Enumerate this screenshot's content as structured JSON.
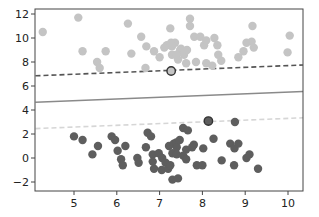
{
  "chart_data": {
    "type": "scatter",
    "title": "",
    "xlabel": "",
    "ylabel": "",
    "xlim": [
      4.1,
      10.35
    ],
    "ylim": [
      -2.5,
      12.5
    ],
    "grid": false,
    "legend": null,
    "x_ticks": [
      5,
      6,
      7,
      8,
      9,
      10
    ],
    "y_ticks": [
      -2,
      0,
      2,
      4,
      6,
      8,
      10,
      12
    ],
    "x_tick_labels": [
      "5",
      "6",
      "7",
      "8",
      "9",
      "10"
    ],
    "y_tick_labels": [
      "−2",
      "0",
      "2",
      "4",
      "6",
      "8",
      "10",
      "12"
    ],
    "colors": {
      "class_light": "#c4c4c4",
      "class_dark": "#5e5e5e",
      "margin_upper": "#555555",
      "decision_boundary": "#8a8a8a",
      "margin_lower": "#d6d6d6",
      "axis": "#444444",
      "support_vector_ring": "#333333"
    },
    "series": [
      {
        "name": "class_light",
        "points": [
          [
            4.27,
            10.5
          ],
          [
            5.1,
            11.7
          ],
          [
            5.2,
            8.9
          ],
          [
            5.74,
            8.9
          ],
          [
            6.26,
            11.2
          ],
          [
            6.34,
            8.7
          ],
          [
            5.54,
            8.0
          ],
          [
            5.6,
            7.5
          ],
          [
            6.57,
            10.1
          ],
          [
            6.69,
            9.3
          ],
          [
            6.87,
            8.9
          ],
          [
            7.0,
            8.4
          ],
          [
            6.67,
            7.5
          ],
          [
            7.27,
            9.6
          ],
          [
            7.17,
            9.4
          ],
          [
            7.36,
            9.6
          ],
          [
            7.5,
            9.1
          ],
          [
            7.29,
            8.6
          ],
          [
            7.48,
            9.0
          ],
          [
            7.57,
            8.6
          ],
          [
            7.64,
            9.0
          ],
          [
            7.43,
            8.2
          ],
          [
            7.62,
            7.9
          ],
          [
            7.81,
            10.1
          ],
          [
            7.71,
            11.0
          ],
          [
            7.71,
            11.6
          ],
          [
            7.95,
            10.1
          ],
          [
            8.04,
            9.4
          ],
          [
            8.09,
            9.8
          ],
          [
            8.28,
            10.0
          ],
          [
            8.35,
            9.4
          ],
          [
            8.37,
            8.6
          ],
          [
            7.85,
            8.0
          ],
          [
            8.09,
            7.9
          ],
          [
            8.23,
            7.7
          ],
          [
            8.44,
            8.1
          ],
          [
            8.84,
            8.4
          ],
          [
            8.96,
            8.9
          ],
          [
            9.03,
            9.6
          ],
          [
            9.15,
            9.7
          ],
          [
            9.17,
            11.0
          ],
          [
            9.2,
            9.2
          ],
          [
            10.04,
            10.2
          ],
          [
            9.99,
            8.8
          ],
          [
            7.25,
            10.8
          ],
          [
            7.29,
            9.3
          ],
          [
            7.11,
            9.2
          ],
          [
            7.39,
            8.6
          ]
        ]
      },
      {
        "name": "class_dark",
        "points": [
          [
            5.0,
            1.8
          ],
          [
            5.2,
            1.5
          ],
          [
            5.43,
            0.3
          ],
          [
            5.56,
            1.0
          ],
          [
            5.88,
            1.8
          ],
          [
            5.96,
            1.5
          ],
          [
            6.02,
            0.6
          ],
          [
            6.1,
            -0.1
          ],
          [
            6.14,
            -0.6
          ],
          [
            6.2,
            1.0
          ],
          [
            6.48,
            0.0
          ],
          [
            6.51,
            -0.4
          ],
          [
            6.72,
            2.1
          ],
          [
            6.8,
            1.8
          ],
          [
            6.68,
            0.9
          ],
          [
            6.84,
            0.3
          ],
          [
            6.87,
            -0.9
          ],
          [
            6.84,
            -0.3
          ],
          [
            6.98,
            0.4
          ],
          [
            7.05,
            -1.0
          ],
          [
            7.22,
            1.0
          ],
          [
            7.3,
            0.4
          ],
          [
            7.33,
            1.2
          ],
          [
            7.39,
            1.3
          ],
          [
            7.06,
            0.0
          ],
          [
            7.14,
            -0.4
          ],
          [
            7.2,
            -0.9
          ],
          [
            7.3,
            -1.8
          ],
          [
            7.43,
            -1.7
          ],
          [
            7.25,
            -0.6
          ],
          [
            7.4,
            0.9
          ],
          [
            7.55,
            2.5
          ],
          [
            7.62,
            0.7
          ],
          [
            7.4,
            0.3
          ],
          [
            7.55,
            0.2
          ],
          [
            7.62,
            -0.1
          ],
          [
            7.8,
            1.1
          ],
          [
            7.76,
            0.9
          ],
          [
            7.87,
            -0.6
          ],
          [
            8.0,
            -0.6
          ],
          [
            8.02,
            0.8
          ],
          [
            8.26,
            1.6
          ],
          [
            8.45,
            -0.2
          ],
          [
            8.65,
            1.2
          ],
          [
            8.75,
            0.8
          ],
          [
            8.84,
            1.2
          ],
          [
            8.74,
            -0.6
          ],
          [
            9.03,
            0.0
          ],
          [
            9.1,
            0.3
          ],
          [
            9.3,
            -0.9
          ],
          [
            8.76,
            3.0
          ],
          [
            7.66,
            2.3
          ],
          [
            7.47,
            1.5
          ]
        ]
      }
    ],
    "support_vectors": [
      [
        7.27,
        7.25
      ],
      [
        8.14,
        3.08
      ]
    ],
    "lines": [
      {
        "name": "margin_upper",
        "style": "dashed",
        "x": [
          4.1,
          10.35
        ],
        "y": [
          6.85,
          7.75
        ]
      },
      {
        "name": "decision_boundary",
        "style": "solid",
        "x": [
          4.1,
          10.35
        ],
        "y": [
          4.65,
          5.55
        ]
      },
      {
        "name": "margin_lower",
        "style": "dashed",
        "x": [
          4.1,
          10.35
        ],
        "y": [
          2.45,
          3.35
        ]
      }
    ]
  }
}
